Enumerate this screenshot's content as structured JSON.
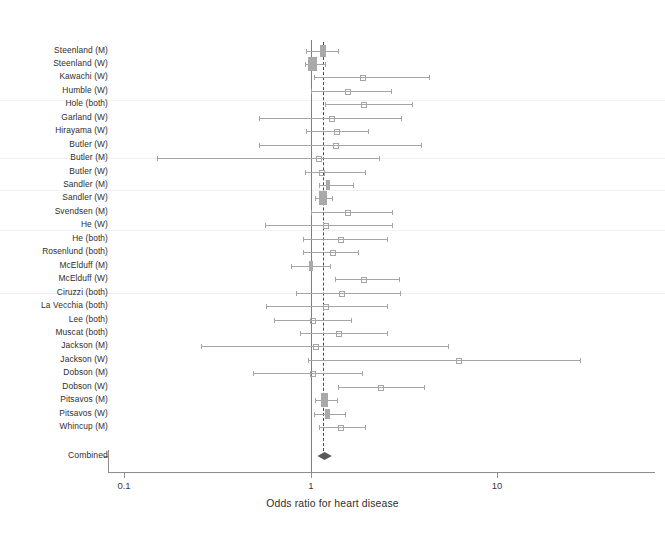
{
  "chart_data": {
    "type": "forest",
    "title": "",
    "xlabel": "Odds ratio for heart disease",
    "ylabel": "",
    "xscale": "log",
    "xlim": [
      0.1,
      30
    ],
    "xticks": [
      0.1,
      1,
      10
    ],
    "xticklabels": [
      "0.1",
      "1",
      "10"
    ],
    "grid": false,
    "legend": null,
    "reference_line": 1.0,
    "pooled_line": 1.16,
    "marker_color": "#a9a9a9",
    "line_color": "#a5a5a5",
    "diamond_color": "#5a5a5a",
    "studies": [
      {
        "label": "Steenland (M)",
        "or": 1.17,
        "lo": 0.95,
        "hi": 1.4,
        "box": 5.5,
        "marker": "box"
      },
      {
        "label": "Steenland (W)",
        "or": 1.03,
        "lo": 0.94,
        "hi": 1.19,
        "box": 9.0,
        "marker": "box"
      },
      {
        "label": "Kawachi (W)",
        "or": 1.91,
        "lo": 1.05,
        "hi": 4.3,
        "box": 0,
        "marker": "point"
      },
      {
        "label": "Humble (W)",
        "or": 1.58,
        "lo": 1.0,
        "hi": 2.69,
        "box": 0,
        "marker": "point"
      },
      {
        "label": "Hole (both)",
        "or": 1.93,
        "lo": 1.2,
        "hi": 3.48,
        "box": 0,
        "marker": "point"
      },
      {
        "label": "Garland (W)",
        "or": 1.29,
        "lo": 0.53,
        "hi": 3.07,
        "box": 0,
        "marker": "point"
      },
      {
        "label": "Hirayama (W)",
        "or": 1.38,
        "lo": 0.95,
        "hi": 2.04,
        "box": 0,
        "marker": "point"
      },
      {
        "label": "Butler (W)",
        "or": 1.36,
        "lo": 0.53,
        "hi": 3.9,
        "box": 0,
        "marker": "point"
      },
      {
        "label": "Butler (M)",
        "or": 1.11,
        "lo": 0.15,
        "hi": 2.33,
        "box": 0,
        "marker": "point"
      },
      {
        "label": "Butler (W)",
        "or": 1.14,
        "lo": 0.94,
        "hi": 1.95,
        "box": 0,
        "marker": "point"
      },
      {
        "label": "Sandler (M)",
        "or": 1.24,
        "lo": 1.11,
        "hi": 1.68,
        "box": 4.5,
        "marker": "box"
      },
      {
        "label": "Sandler (W)",
        "or": 1.17,
        "lo": 1.06,
        "hi": 1.31,
        "box": 8.5,
        "marker": "box"
      },
      {
        "label": "Svendsen (M)",
        "or": 1.58,
        "lo": 1.0,
        "hi": 2.74,
        "box": 0,
        "marker": "point"
      },
      {
        "label": "He (W)",
        "or": 1.2,
        "lo": 0.57,
        "hi": 2.74,
        "box": 0,
        "marker": "point"
      },
      {
        "label": "He (both)",
        "or": 1.44,
        "lo": 0.91,
        "hi": 2.56,
        "box": 0,
        "marker": "point"
      },
      {
        "label": "Rosenlund (both)",
        "or": 1.32,
        "lo": 0.91,
        "hi": 1.79,
        "box": 0,
        "marker": "point"
      },
      {
        "label": "McElduff (M)",
        "or": 1.01,
        "lo": 0.79,
        "hi": 1.28,
        "box": 4.0,
        "marker": "box"
      },
      {
        "label": "McElduff (W)",
        "or": 1.93,
        "lo": 1.36,
        "hi": 2.98,
        "box": 0,
        "marker": "point"
      },
      {
        "label": "Ciruzzi (both)",
        "or": 1.47,
        "lo": 0.84,
        "hi": 3.03,
        "box": 0,
        "marker": "point"
      },
      {
        "label": "La Vecchia (both)",
        "or": 1.2,
        "lo": 0.58,
        "hi": 2.56,
        "box": 0,
        "marker": "point"
      },
      {
        "label": "Lee (both)",
        "or": 1.03,
        "lo": 0.64,
        "hi": 1.65,
        "box": 0,
        "marker": "point"
      },
      {
        "label": "Muscat (both)",
        "or": 1.42,
        "lo": 0.88,
        "hi": 2.56,
        "box": 0,
        "marker": "point"
      },
      {
        "label": "Jackson (M)",
        "or": 1.06,
        "lo": 0.26,
        "hi": 5.43,
        "box": 0,
        "marker": "point"
      },
      {
        "label": "Jackson (W)",
        "or": 6.21,
        "lo": 0.97,
        "hi": 28.0,
        "box": 0,
        "marker": "point"
      },
      {
        "label": "Dobson (M)",
        "or": 1.02,
        "lo": 0.49,
        "hi": 1.88,
        "box": 0,
        "marker": "point"
      },
      {
        "label": "Dobson (W)",
        "or": 2.38,
        "lo": 1.4,
        "hi": 4.05,
        "box": 0,
        "marker": "point"
      },
      {
        "label": "Pitsavos (M)",
        "or": 1.19,
        "lo": 1.06,
        "hi": 1.39,
        "box": 6.5,
        "marker": "box"
      },
      {
        "label": "Pitsavos (W)",
        "or": 1.24,
        "lo": 1.04,
        "hi": 1.54,
        "box": 5.0,
        "marker": "box"
      },
      {
        "label": "Whincup (M)",
        "or": 1.44,
        "lo": 1.11,
        "hi": 1.96,
        "box": 0,
        "marker": "point"
      }
    ],
    "combined": {
      "label": "Combined",
      "or": 1.19,
      "lo": 1.09,
      "hi": 1.3
    }
  }
}
